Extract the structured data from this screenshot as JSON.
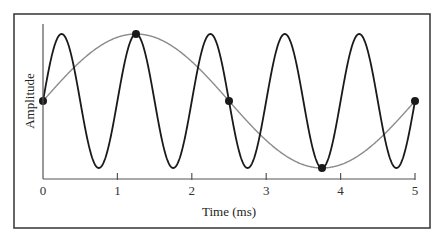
{
  "chart_data": {
    "type": "line",
    "title": "",
    "xlabel": "Time (ms)",
    "ylabel": "Amplitude",
    "xlim": [
      0,
      5
    ],
    "ylim": [
      -1,
      1
    ],
    "x_ticks": [
      0,
      1,
      2,
      3,
      4,
      5
    ],
    "x_tick_labels": [
      "0",
      "1",
      "2",
      "3",
      "4",
      "5"
    ],
    "grid": false,
    "legend": null,
    "series": [
      {
        "name": "Original signal (1 kHz)",
        "frequency_khz": 1.0,
        "amplitude": 1,
        "function": "sin(2*pi*f*t)",
        "color": "#1a1a1a",
        "peaks_t_ms": [
          0.25,
          1.25,
          2.25,
          3.25,
          4.25
        ],
        "troughs_t_ms": [
          0.75,
          1.75,
          2.75,
          3.75,
          4.75
        ]
      },
      {
        "name": "Aliased signal (0.2 kHz)",
        "frequency_khz": 0.2,
        "amplitude": 1,
        "function": "sin(2*pi*f*t)",
        "color": "#8c8c8c",
        "peaks_t_ms": [
          1.25
        ],
        "troughs_t_ms": [
          3.75
        ]
      }
    ],
    "sample_points": {
      "name": "Samples",
      "color": "#1a1a1a",
      "t_ms": [
        0,
        1.25,
        2.5,
        3.75,
        5
      ],
      "values": [
        0,
        1,
        0,
        -1,
        0
      ]
    }
  },
  "colors": {
    "fast_wave": "#1a1a1a",
    "slow_wave": "#8c8c8c",
    "dots": "#1a1a1a",
    "frame": "#333333"
  }
}
